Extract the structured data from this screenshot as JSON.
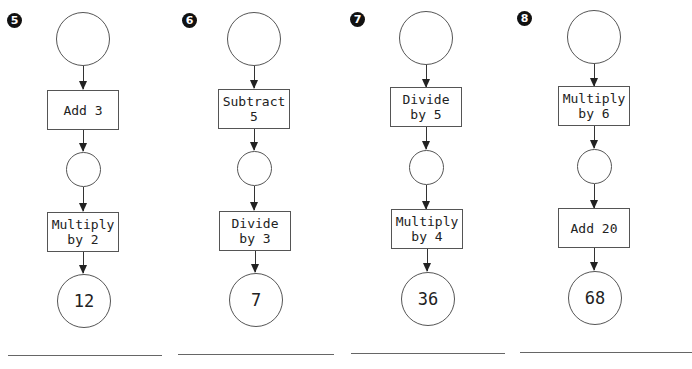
{
  "problems": [
    {
      "number": "5",
      "number_badge_icon": "black-circle-number-5",
      "start_value": "",
      "step1": "Add 3",
      "middle_value": "",
      "step2": "Multiply\nby 2",
      "end_value": "12",
      "answer": ""
    },
    {
      "number": "6",
      "number_badge_icon": "black-circle-number-6",
      "start_value": "",
      "step1": "Subtract\n5",
      "middle_value": "",
      "step2": "Divide\nby 3",
      "end_value": "7",
      "answer": ""
    },
    {
      "number": "7",
      "number_badge_icon": "black-circle-number-7",
      "start_value": "",
      "step1": "Divide\nby 5",
      "middle_value": "",
      "step2": "Multiply\nby 4",
      "end_value": "36",
      "answer": ""
    },
    {
      "number": "8",
      "number_badge_icon": "black-circle-number-8",
      "start_value": "",
      "step1": "Multiply\nby 6",
      "middle_value": "",
      "step2": "Add 20",
      "end_value": "68",
      "answer": ""
    }
  ]
}
